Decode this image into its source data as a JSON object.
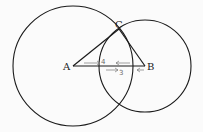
{
  "diagram": {
    "type": "geometry-construction",
    "circles": [
      {
        "name": "circle-centered-A",
        "cx": 73,
        "cy": 66,
        "r": 60
      },
      {
        "name": "circle-centered-B",
        "cx": 145,
        "cy": 66,
        "r": 46
      }
    ],
    "points": {
      "A": {
        "label": "A",
        "x": 73,
        "y": 66
      },
      "B": {
        "label": "B",
        "x": 145,
        "y": 66
      },
      "C": {
        "label": "C",
        "x": 119,
        "y": 29
      }
    },
    "segments": [
      [
        "A",
        "B"
      ],
      [
        "A",
        "C"
      ],
      [
        "B",
        "C"
      ]
    ],
    "annotations": {
      "upper": "4",
      "lower": "3"
    },
    "colors": {
      "line": "#1a1a1a",
      "annotation": "#7a7a7a"
    }
  }
}
